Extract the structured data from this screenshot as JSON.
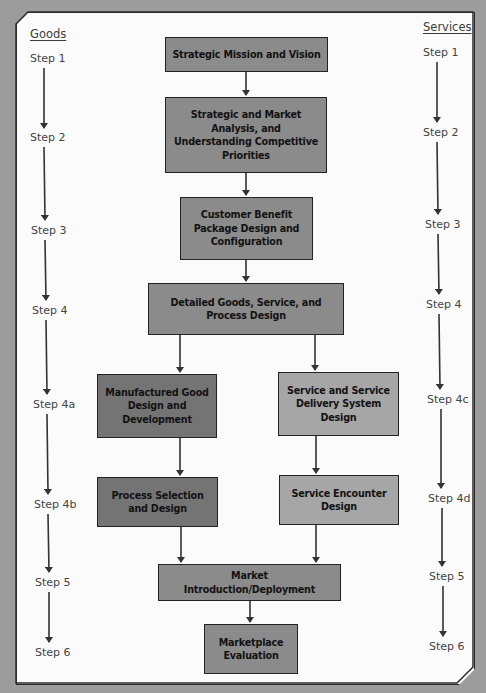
{
  "diagram": {
    "colors": {
      "background": "#9c9c9c",
      "panel": "#fbfbfb",
      "core_box": "#8b8b8b",
      "goods_box": "#747474",
      "services_box": "#a6a6a6",
      "stroke": "#222222"
    },
    "goods_column": {
      "title": "Goods",
      "steps": [
        "Step 1",
        "Step 2",
        "Step 3",
        "Step 4",
        "Step 4a",
        "Step 4b",
        "Step 5",
        "Step 6"
      ]
    },
    "services_column": {
      "title": "Services",
      "steps": [
        "Step 1",
        "Step 2",
        "Step 3",
        "Step 4",
        "Step 4c",
        "Step 4d",
        "Step 5",
        "Step 6"
      ]
    },
    "boxes": {
      "mission": "Strategic Mission and Vision",
      "analysis": "Strategic and Market Analysis, and Understanding Competitive Priorities",
      "cbp": "Customer Benefit Package Design and Configuration",
      "detailed": "Detailed Goods, Service, and Process Design",
      "manufactured": "Manufactured Good Design and Development",
      "service_system": "Service and Service Delivery System Design",
      "process_selection": "Process Selection and Design",
      "service_encounter": "Service Encounter Design",
      "market_intro": "Market Introduction/Deployment",
      "evaluation": "Marketplace Evaluation"
    }
  }
}
